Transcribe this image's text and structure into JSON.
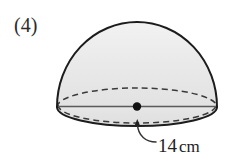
{
  "figure": {
    "item_number_label": "(4)",
    "shape_name": "hemisphere",
    "dimension": {
      "value": "14",
      "unit": "cm",
      "full_label": "14cm",
      "refers_to": "diameter"
    },
    "colors": {
      "background": "#ffffff",
      "surface_fill": "#e9e9e9",
      "outline_stroke": "#1c1c1c",
      "hidden_edge_stroke": "#3a3a3a",
      "diameter_line_stroke": "#555555",
      "center_dot_fill": "#111111",
      "leader_line_stroke": "#333333",
      "text_color": "#222222"
    },
    "geometry": {
      "dome_apex_y": 22,
      "dome_left_x": 58,
      "dome_right_x": 217,
      "dome_center_x": 137,
      "equator_center_y": 107,
      "equator_radius_x": 80,
      "equator_radius_y": 19,
      "rim_bottom_y": 126,
      "center_dot_x": 137,
      "center_dot_y": 107,
      "center_dot_radius": 4,
      "arrow_tip_x": 137,
      "arrow_tip_y": 121
    }
  }
}
